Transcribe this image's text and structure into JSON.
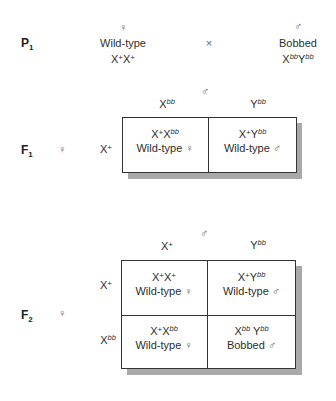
{
  "p1": {
    "label": "P",
    "label_sub": "1",
    "female": {
      "symbol": "♀",
      "phenotype": "Wild-type",
      "genotype": [
        {
          "base": "X",
          "sup": "+",
          "plus": true
        },
        {
          "base": "X",
          "sup": "+",
          "plus": true
        }
      ]
    },
    "cross_symbol": "×",
    "male": {
      "symbol": "♂",
      "phenotype": "Bobbed",
      "genotype": [
        {
          "base": "X",
          "sup": "bb",
          "plus": false
        },
        {
          "base": "Y",
          "sup": "bb",
          "plus": false
        }
      ]
    }
  },
  "f1": {
    "label": "F",
    "label_sub": "1",
    "female_symbol": "♀",
    "male_symbol": "♂",
    "col_headers": [
      {
        "base": "X",
        "sup": "bb"
      },
      {
        "base": "Y",
        "sup": "bb"
      }
    ],
    "row_headers": [
      {
        "base": "X",
        "sup": "+"
      }
    ],
    "cells": [
      [
        {
          "genotype": [
            {
              "base": "X",
              "sup": "+"
            },
            {
              "base": "X",
              "sup": "bb"
            }
          ],
          "phenotype": "Wild-type",
          "sex": "♀"
        },
        {
          "genotype": [
            {
              "base": "X",
              "sup": "+"
            },
            {
              "base": "Y",
              "sup": "bb"
            }
          ],
          "phenotype": "Wild-type",
          "sex": "♂"
        }
      ]
    ]
  },
  "f2": {
    "label": "F",
    "label_sub": "2",
    "female_symbol": "♀",
    "male_symbol": "♂",
    "col_headers": [
      {
        "base": "X",
        "sup": "+"
      },
      {
        "base": "Y",
        "sup": "bb"
      }
    ],
    "row_headers": [
      {
        "base": "X",
        "sup": "+"
      },
      {
        "base": "X",
        "sup": "bb"
      }
    ],
    "cells": [
      [
        {
          "genotype": [
            {
              "base": "X",
              "sup": "+"
            },
            {
              "base": "X",
              "sup": "+"
            }
          ],
          "phenotype": "Wild-type",
          "sex": "♀"
        },
        {
          "genotype": [
            {
              "base": "X",
              "sup": "+"
            },
            {
              "base": "Y",
              "sup": "bb"
            }
          ],
          "phenotype": "Wild-type",
          "sex": "♂"
        }
      ],
      [
        {
          "genotype": [
            {
              "base": "X",
              "sup": "+"
            },
            {
              "base": "X",
              "sup": "bb"
            }
          ],
          "phenotype": "Wild-type",
          "sex": "♀"
        },
        {
          "genotype": [
            {
              "base": "X",
              "sup": "bb"
            },
            {
              "base": "Y",
              "sup": "bb"
            }
          ],
          "phenotype": "Bobbed",
          "sex": "♂"
        }
      ]
    ]
  },
  "colors": {
    "text": "#2e2e2e",
    "border": "#333333",
    "shadow": "#a9a9a9",
    "background": "#ffffff"
  }
}
